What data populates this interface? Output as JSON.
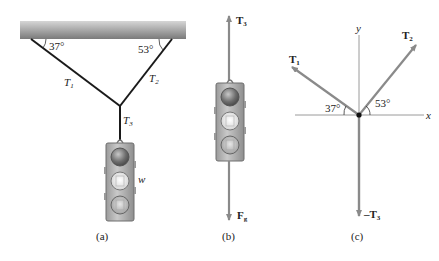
{
  "panels": {
    "a": {
      "caption": "(a)",
      "angle_left": "37°",
      "angle_right": "53°",
      "rope_left": "T",
      "rope_left_sub": "1",
      "rope_right": "T",
      "rope_right_sub": "2",
      "rope_vertical": "T",
      "rope_vertical_sub": "3",
      "weight_label": "w"
    },
    "b": {
      "caption": "(b)",
      "up_force": "T",
      "up_force_sub": "3",
      "down_force": "F",
      "down_force_sub": "g"
    },
    "c": {
      "caption": "(c)",
      "x_axis": "x",
      "y_axis": "y",
      "vec1": "T",
      "vec1_sub": "1",
      "vec2": "T",
      "vec2_sub": "2",
      "vec3": "–T",
      "vec3_sub": "3",
      "angle_left": "37°",
      "angle_right": "53°"
    }
  },
  "colors": {
    "ceiling_dark": "#7d7d7d",
    "ceiling_light": "#cfcfcf",
    "rope": "#1a1a1a",
    "vector": "#8a8a8a",
    "axis": "#9a9a9a",
    "light_body": "#b4b4b4"
  }
}
